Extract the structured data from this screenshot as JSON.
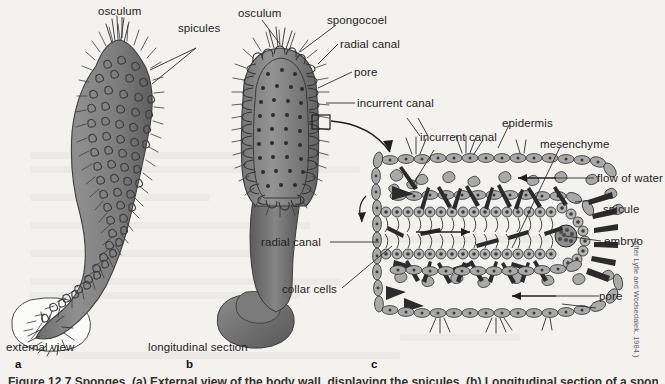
{
  "figure": {
    "caption": "Figure 12.7   Sponges. (a) External view of the body wall, displaying the spicules. (b) Longitudinal section of a sponge, showing the spongocoel, radial canals and pores. (c) Magnified view of the body wall in detail.",
    "credit": "(After Lytle and Wodsedalek, 1984.)"
  },
  "panels": [
    {
      "letter": "a",
      "title": "external view"
    },
    {
      "letter": "b",
      "title": "longitudinal section"
    },
    {
      "letter": "c",
      "title": ""
    }
  ],
  "labels": {
    "panel_a": [
      {
        "name": "osculum",
        "text": "osculum"
      },
      {
        "name": "spicules",
        "text": "spicules"
      }
    ],
    "panel_b": [
      {
        "name": "osculum",
        "text": "osculum"
      },
      {
        "name": "spongocoel",
        "text": "spongocoel"
      },
      {
        "name": "radial-canal",
        "text": "radial canal"
      },
      {
        "name": "pore",
        "text": "pore"
      },
      {
        "name": "incurrent-canal",
        "text": "incurrent canal"
      }
    ],
    "panel_c": [
      {
        "name": "incurrent-canal",
        "text": "incurrent canal"
      },
      {
        "name": "epidermis",
        "text": "epidermis"
      },
      {
        "name": "mesenchyme",
        "text": "mesenchyme"
      },
      {
        "name": "flow-of-water",
        "text": "flow of water"
      },
      {
        "name": "spicule",
        "text": "spicule"
      },
      {
        "name": "embryo",
        "text": "embryo"
      },
      {
        "name": "pore",
        "text": "pore"
      },
      {
        "name": "radial-canal",
        "text": "radial canal"
      },
      {
        "name": "collar-cells",
        "text": "collar cells"
      }
    ]
  },
  "colors": {
    "page_background": "#f3f2ef",
    "body_gray": "#8a8a8a",
    "body_gray_dark": "#6f6f6f",
    "body_gray_darkest": "#545454",
    "cell_fill": "#a9a9a9",
    "ink": "#2b2b2b",
    "label_text": "#222222"
  }
}
